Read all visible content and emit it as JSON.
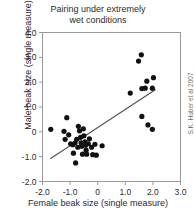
{
  "chart_data": {
    "type": "scatter",
    "title": "Pairing under extremely wet conditions",
    "title_line1": "Pairing under extremely",
    "title_line2": "wet conditions",
    "xlabel": "Female beak size (single measure)",
    "ylabel": "Male beak size (single measure)",
    "credit": "S.K. Huber et al 2007",
    "xlim": [
      -2.0,
      3.0
    ],
    "ylim": [
      -2.0,
      4.0
    ],
    "xticks": [
      -2.0,
      -1.0,
      0,
      1.0,
      2.0,
      3.0
    ],
    "xtick_labels": [
      "-2.0",
      "-1.0",
      "0",
      "1.0",
      "2.0",
      "3.0"
    ],
    "yticks": [
      -2.0,
      -1.0,
      0,
      1.0,
      2.0,
      3.0,
      4.0
    ],
    "ytick_labels": [
      "-2.0",
      "-1.0",
      "0",
      "1.0",
      "2.0",
      "3.0",
      "4.0"
    ],
    "grid": false,
    "legend": "none",
    "marker": "filled-circle",
    "marker_color": "#111111",
    "marker_size_px": 5.2,
    "points": [
      {
        "x": -1.7,
        "y": 0.1
      },
      {
        "x": -1.12,
        "y": 0.57
      },
      {
        "x": -1.22,
        "y": 0.02
      },
      {
        "x": -1.18,
        "y": -0.3
      },
      {
        "x": -1.05,
        "y": -0.12
      },
      {
        "x": -0.98,
        "y": -0.48
      },
      {
        "x": -0.9,
        "y": -0.52
      },
      {
        "x": -0.88,
        "y": -0.86
      },
      {
        "x": -0.8,
        "y": -1.25
      },
      {
        "x": -0.82,
        "y": -0.44
      },
      {
        "x": -0.76,
        "y": -0.3
      },
      {
        "x": -0.72,
        "y": -0.62
      },
      {
        "x": -0.7,
        "y": 0.22
      },
      {
        "x": -0.66,
        "y": 0.04
      },
      {
        "x": -0.62,
        "y": -0.22
      },
      {
        "x": -0.6,
        "y": -0.44
      },
      {
        "x": -0.58,
        "y": -0.58
      },
      {
        "x": -0.55,
        "y": -0.9
      },
      {
        "x": -0.52,
        "y": 0.12
      },
      {
        "x": -0.5,
        "y": -0.16
      },
      {
        "x": -0.46,
        "y": -0.4
      },
      {
        "x": -0.44,
        "y": -0.54
      },
      {
        "x": -0.42,
        "y": -0.74
      },
      {
        "x": -0.4,
        "y": -0.9
      },
      {
        "x": -0.34,
        "y": -0.48
      },
      {
        "x": -0.3,
        "y": -0.28
      },
      {
        "x": -0.22,
        "y": -0.62
      },
      {
        "x": -0.18,
        "y": -0.92
      },
      {
        "x": -0.1,
        "y": -0.5
      },
      {
        "x": -0.05,
        "y": -0.94
      },
      {
        "x": 0.16,
        "y": -0.56
      },
      {
        "x": 1.18,
        "y": 1.56
      },
      {
        "x": 1.48,
        "y": 2.85
      },
      {
        "x": 1.58,
        "y": 3.1
      },
      {
        "x": 1.6,
        "y": 1.74
      },
      {
        "x": 1.72,
        "y": 1.76
      },
      {
        "x": 1.78,
        "y": 2.04
      },
      {
        "x": 1.98,
        "y": 1.76
      },
      {
        "x": 2.02,
        "y": 2.18
      },
      {
        "x": 1.6,
        "y": 0.62
      },
      {
        "x": 1.82,
        "y": 0.28
      },
      {
        "x": 1.98,
        "y": 0.1
      }
    ],
    "trendline": {
      "type": "linear",
      "x_start": -1.72,
      "y_start": -1.08,
      "x_end": 2.1,
      "y_end": 1.7,
      "color": "#555555"
    }
  }
}
